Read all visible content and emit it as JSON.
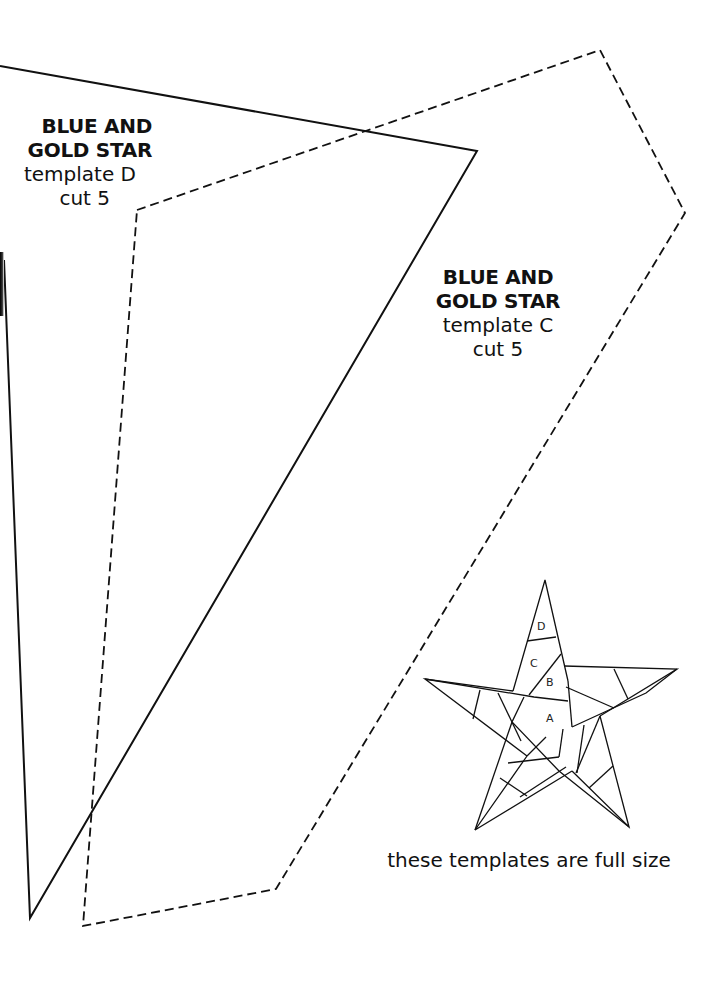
{
  "templates": {
    "d": {
      "title_line1": "BLUE AND",
      "title_line2": "GOLD STAR",
      "name": "template D",
      "cut": "cut 5",
      "outline_style": "solid"
    },
    "c": {
      "title_line1": "BLUE AND",
      "title_line2": "GOLD STAR",
      "name": "template C",
      "cut": "cut 5",
      "outline_style": "dashed"
    }
  },
  "star_diagram": {
    "piece_labels": [
      "A",
      "B",
      "C",
      "D"
    ]
  },
  "caption": "these templates are full size",
  "colors": {
    "background": "#ffffff",
    "ink": "#111111"
  }
}
